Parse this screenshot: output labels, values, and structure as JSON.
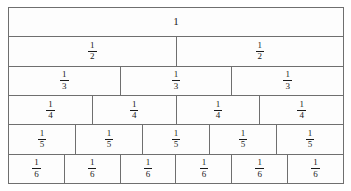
{
  "diagram": {
    "border_color": "#6f6f6f",
    "text_color": "#1a1a1a",
    "background_color": "#fdfdfd"
  },
  "rows": [
    {
      "name": "whole",
      "denominator": 1,
      "cell_count": 1,
      "cells": [
        {
          "label": "1",
          "numerator": "1",
          "denominator": "",
          "is_whole": true
        }
      ]
    },
    {
      "name": "halves",
      "denominator": 2,
      "cell_count": 2,
      "cells": [
        {
          "label": "1/2",
          "numerator": "1",
          "denominator": "2",
          "is_whole": false
        },
        {
          "label": "1/2",
          "numerator": "1",
          "denominator": "2",
          "is_whole": false
        }
      ]
    },
    {
      "name": "thirds",
      "denominator": 3,
      "cell_count": 3,
      "cells": [
        {
          "label": "1/3",
          "numerator": "1",
          "denominator": "3",
          "is_whole": false
        },
        {
          "label": "1/3",
          "numerator": "1",
          "denominator": "3",
          "is_whole": false
        },
        {
          "label": "1/3",
          "numerator": "1",
          "denominator": "3",
          "is_whole": false
        }
      ]
    },
    {
      "name": "fourths",
      "denominator": 4,
      "cell_count": 4,
      "cells": [
        {
          "label": "1/4",
          "numerator": "1",
          "denominator": "4",
          "is_whole": false
        },
        {
          "label": "1/4",
          "numerator": "1",
          "denominator": "4",
          "is_whole": false
        },
        {
          "label": "1/4",
          "numerator": "1",
          "denominator": "4",
          "is_whole": false
        },
        {
          "label": "1/4",
          "numerator": "1",
          "denominator": "4",
          "is_whole": false
        }
      ]
    },
    {
      "name": "fifths",
      "denominator": 5,
      "cell_count": 5,
      "cells": [
        {
          "label": "1/5",
          "numerator": "1",
          "denominator": "5",
          "is_whole": false
        },
        {
          "label": "1/5",
          "numerator": "1",
          "denominator": "5",
          "is_whole": false
        },
        {
          "label": "1/5",
          "numerator": "1",
          "denominator": "5",
          "is_whole": false
        },
        {
          "label": "1/5",
          "numerator": "1",
          "denominator": "5",
          "is_whole": false
        },
        {
          "label": "1/5",
          "numerator": "1",
          "denominator": "5",
          "is_whole": false
        }
      ]
    },
    {
      "name": "sixths",
      "denominator": 6,
      "cell_count": 6,
      "cells": [
        {
          "label": "1/6",
          "numerator": "1",
          "denominator": "6",
          "is_whole": false
        },
        {
          "label": "1/6",
          "numerator": "1",
          "denominator": "6",
          "is_whole": false
        },
        {
          "label": "1/6",
          "numerator": "1",
          "denominator": "6",
          "is_whole": false
        },
        {
          "label": "1/6",
          "numerator": "1",
          "denominator": "6",
          "is_whole": false
        },
        {
          "label": "1/6",
          "numerator": "1",
          "denominator": "6",
          "is_whole": false
        },
        {
          "label": "1/6",
          "numerator": "1",
          "denominator": "6",
          "is_whole": false
        }
      ]
    }
  ]
}
